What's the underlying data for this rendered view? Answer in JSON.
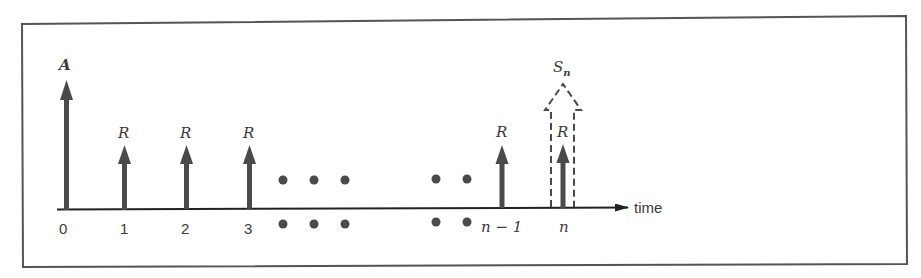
{
  "diagram": {
    "axis_label": "time",
    "initial": {
      "label": "A",
      "tick": "0"
    },
    "payments": [
      {
        "label": "R",
        "tick": "1"
      },
      {
        "label": "R",
        "tick": "2"
      },
      {
        "label": "R",
        "tick": "3"
      },
      {
        "label": "R",
        "tick": "n − 1"
      },
      {
        "label": "R",
        "tick": "n"
      }
    ],
    "final_sum": {
      "label": "S",
      "subscript": "n"
    },
    "ellipsis": "• • •   • •",
    "colors": {
      "arrow": "#4a4a4a",
      "border": "#555555",
      "text": "#3a3a3a"
    }
  }
}
